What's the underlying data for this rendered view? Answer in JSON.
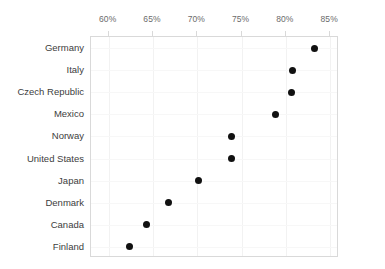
{
  "chart_data": {
    "type": "scatter",
    "title": "",
    "subtitle": "",
    "xlabel": "",
    "ylabel": "",
    "orientation": "horizontal",
    "xlim": [
      58.0,
      86.0
    ],
    "grid": true,
    "legend": null,
    "x_tick_labels": [
      "60%",
      "65%",
      "70%",
      "75%",
      "80%",
      "85%"
    ],
    "x_tick_values": [
      60,
      65,
      70,
      75,
      80,
      85
    ],
    "categories": [
      "Germany",
      "Italy",
      "Czech Republic",
      "Mexico",
      "Norway",
      "United States",
      "Japan",
      "Denmark",
      "Canada",
      "Finland"
    ],
    "values": [
      83.2,
      80.7,
      80.6,
      78.8,
      73.9,
      73.9,
      70.1,
      66.8,
      64.3,
      62.3
    ],
    "value_labels": [
      "83.2%",
      "80.7%",
      "80.6%",
      "78.8%",
      "73.9%",
      "73.9%",
      "70.1%",
      "66.8%",
      "64.3%",
      "62.3%"
    ],
    "marker": "circle",
    "marker_color": "#111111",
    "axis_color": "#d9d9d9",
    "grid_color": "#f2f2f2",
    "tick_label_color": "#6b6b6b",
    "category_label_color": "#3d3d3d",
    "background_color": "#ffffff"
  }
}
